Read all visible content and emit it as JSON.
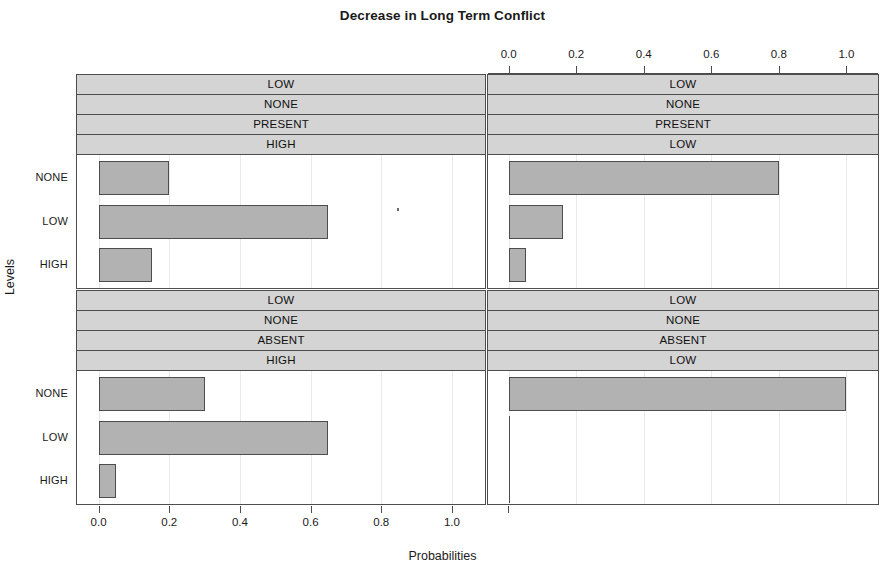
{
  "chart": {
    "title": "Decrease in Long Term Conflict",
    "xlabel": "Probabilities",
    "ylabel": "Levels"
  },
  "axis": {
    "tick_labels": [
      "0.0",
      "0.2",
      "0.4",
      "0.6",
      "0.8",
      "1.0"
    ],
    "tick_values": [
      0.0,
      0.2,
      0.4,
      0.6,
      0.8,
      1.0
    ],
    "y_categories": [
      "NONE",
      "LOW",
      "HIGH"
    ]
  },
  "panels": [
    {
      "id": "top-left",
      "strips": [
        "LOW",
        "NONE",
        "PRESENT",
        "HIGH"
      ],
      "values": [
        0.2,
        0.65,
        0.15
      ]
    },
    {
      "id": "top-right",
      "strips": [
        "LOW",
        "NONE",
        "PRESENT",
        "LOW"
      ],
      "values": [
        0.8,
        0.16,
        0.05
      ]
    },
    {
      "id": "bottom-left",
      "strips": [
        "LOW",
        "NONE",
        "ABSENT",
        "HIGH"
      ],
      "values": [
        0.3,
        0.65,
        0.05
      ]
    },
    {
      "id": "bottom-right",
      "strips": [
        "LOW",
        "NONE",
        "ABSENT",
        "LOW"
      ],
      "values": [
        1.0,
        0.0,
        0.0
      ]
    }
  ],
  "chart_data": {
    "type": "bar",
    "orientation": "horizontal",
    "title": "Decrease in Long Term Conflict",
    "xlabel": "Probabilities",
    "ylabel": "Levels",
    "xlim": [
      -0.02,
      1.08
    ],
    "xticks": [
      0.0,
      0.2,
      0.4,
      0.6,
      0.8,
      1.0
    ],
    "xticklabels": [
      "0.0",
      "0.2",
      "0.4",
      "0.6",
      "0.8",
      "1.0"
    ],
    "categories": [
      "NONE",
      "LOW",
      "HIGH"
    ],
    "grid": true,
    "legend": false,
    "layout": "2x2 trellis (lattice barchart) with conditioning strips above each panel",
    "panels": [
      {
        "panel": "top-left",
        "strip_labels": [
          "LOW",
          "NONE",
          "PRESENT",
          "HIGH"
        ],
        "categories": [
          "NONE",
          "LOW",
          "HIGH"
        ],
        "values": [
          0.2,
          0.65,
          0.15
        ]
      },
      {
        "panel": "top-right",
        "strip_labels": [
          "LOW",
          "NONE",
          "PRESENT",
          "LOW"
        ],
        "categories": [
          "NONE",
          "LOW",
          "HIGH"
        ],
        "values": [
          0.8,
          0.16,
          0.05
        ]
      },
      {
        "panel": "bottom-left",
        "strip_labels": [
          "LOW",
          "NONE",
          "ABSENT",
          "HIGH"
        ],
        "categories": [
          "NONE",
          "LOW",
          "HIGH"
        ],
        "values": [
          0.3,
          0.65,
          0.05
        ]
      },
      {
        "panel": "bottom-right",
        "strip_labels": [
          "LOW",
          "NONE",
          "ABSENT",
          "LOW"
        ],
        "categories": [
          "NONE",
          "LOW",
          "HIGH"
        ],
        "values": [
          1.0,
          0.0,
          0.0
        ]
      }
    ],
    "colors": {
      "bar_fill": "#b2b2b2",
      "bar_border": "#4d4d4d",
      "strip_fill": "#d4d4d4",
      "background": "#ffffff"
    }
  }
}
